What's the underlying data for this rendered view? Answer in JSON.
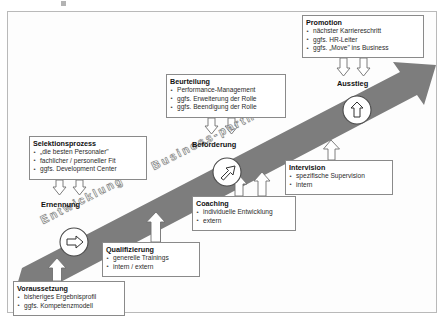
{
  "diagram": {
    "title_band": {
      "word_left": "Entwicklung",
      "word_right": "Business-partner"
    },
    "stages": [
      {
        "name": "ernennung",
        "label": "Ernennung",
        "icon": "arrow-right-circle-icon"
      },
      {
        "name": "befoerderung",
        "label": "Beförderung",
        "icon": "arrow-up-right-circle-icon"
      },
      {
        "name": "ausstieg",
        "label": "Ausstieg",
        "icon": "arrow-up-circle-icon"
      }
    ],
    "boxes": [
      {
        "key": "promotion",
        "title": "Promotion",
        "items": [
          "nächster Karriereschritt",
          "ggfs. HR-Leiter",
          "ggfs. „Move\" ins Business"
        ]
      },
      {
        "key": "beurteilung",
        "title": "Beurteilung",
        "items": [
          "Performance-Management",
          "ggfs. Erweiterung der Rolle",
          "ggfs. Beendigung der Rolle"
        ]
      },
      {
        "key": "selektionsprozess",
        "title": "Selektionsprozess",
        "items": [
          "„die besten Personaler\"",
          "fachlicher / personeller Fit",
          "ggfs. Development Center"
        ]
      },
      {
        "key": "intervision",
        "title": "Intervision",
        "items": [
          "spezifische Supervision",
          "intern"
        ]
      },
      {
        "key": "coaching",
        "title": "Coaching",
        "items": [
          "individuelle Entwicklung",
          "extern"
        ]
      },
      {
        "key": "qualifizierung",
        "title": "Qualifizierung",
        "items": [
          "generelle Trainings",
          "intern / extern"
        ]
      },
      {
        "key": "voraussetzung",
        "title": "Voraussetzung",
        "items": [
          "bisheriges Ergebnisprofil",
          "ggfs. Kompetenzmodell"
        ]
      }
    ],
    "colors": {
      "band": "#7d7d7d",
      "box_border": "#8a8a8a",
      "frame_border": "#b9b9b9",
      "text": "#111111",
      "connector_stroke": "#6f6f6f",
      "background": "#ffffff"
    }
  }
}
